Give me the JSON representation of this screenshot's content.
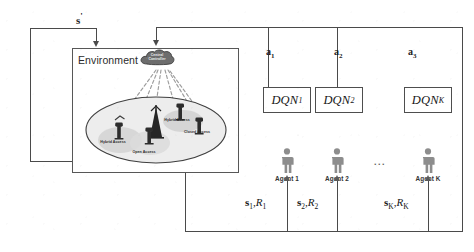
{
  "diagram": {
    "environment": {
      "label": "Environment",
      "controller": {
        "line1": "Central",
        "line2": "Controller",
        "icon": "cloud-icon"
      },
      "access_points": [
        {
          "label": "Hybrid Access",
          "icon": "base-station-icon"
        },
        {
          "label": "Open Access",
          "icon": "base-station-icon"
        },
        {
          "label": "Hybrid Access",
          "icon": "base-station-icon"
        },
        {
          "label": "Closed Access",
          "icon": "base-station-icon"
        }
      ],
      "macro_tower": {
        "icon": "antenna-tower-icon"
      }
    },
    "feedback_label": {
      "text": "s",
      "prime": "'"
    },
    "dqn_blocks": [
      {
        "name": "DQN",
        "sub": "1"
      },
      {
        "name": "DQN",
        "sub": "2"
      },
      {
        "name": "DQN",
        "sub": "K"
      }
    ],
    "agents": [
      {
        "label": "Agent 1",
        "icon": "person-icon"
      },
      {
        "label": "Agent 2",
        "icon": "person-icon"
      },
      {
        "label": "Agent K",
        "icon": "person-icon"
      }
    ],
    "agents_ellipsis": "...",
    "actions": [
      {
        "symbol": "a",
        "sub": "1"
      },
      {
        "symbol": "a",
        "sub": "2"
      },
      {
        "symbol": "a",
        "sub": "3"
      }
    ],
    "state_rewards": [
      {
        "state": "s",
        "state_sub": "1",
        "reward": "R",
        "reward_sub": "1",
        "sep": ","
      },
      {
        "state": "s",
        "state_sub": "2",
        "reward": "R",
        "reward_sub": "2",
        "sep": ","
      },
      {
        "state": "s",
        "state_sub": "K",
        "reward": "R",
        "reward_sub": "K",
        "sep": ","
      }
    ],
    "colors": {
      "line": "#4a4a4a",
      "box_border": "#575757",
      "cloud_fill": "#6a6a6a",
      "cell_fill": "#e9e9e9",
      "agent_fill": "#8f8f8f",
      "text": "#1f1f1f"
    }
  }
}
